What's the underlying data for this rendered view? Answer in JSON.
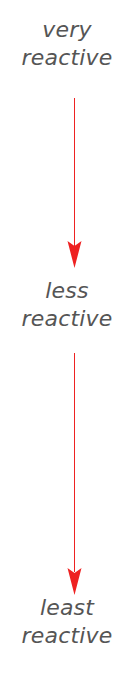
{
  "diagram": {
    "type": "reactivity-series-arrow",
    "title": "",
    "orientation": "vertical-descending",
    "background_color": "#ffffff",
    "text_color": "#555555",
    "arrow_color": "#ee2222",
    "labels": [
      {
        "id": "very",
        "line1": "very",
        "line2": "reactive"
      },
      {
        "id": "less",
        "line1": "less",
        "line2": "reactive"
      },
      {
        "id": "least",
        "line1": "least",
        "line2": "reactive"
      }
    ],
    "arrows": [
      {
        "id": "arrow-very-to-less",
        "from": "very reactive",
        "to": "less reactive"
      },
      {
        "id": "arrow-less-to-least",
        "from": "less reactive",
        "to": "least reactive"
      }
    ]
  }
}
